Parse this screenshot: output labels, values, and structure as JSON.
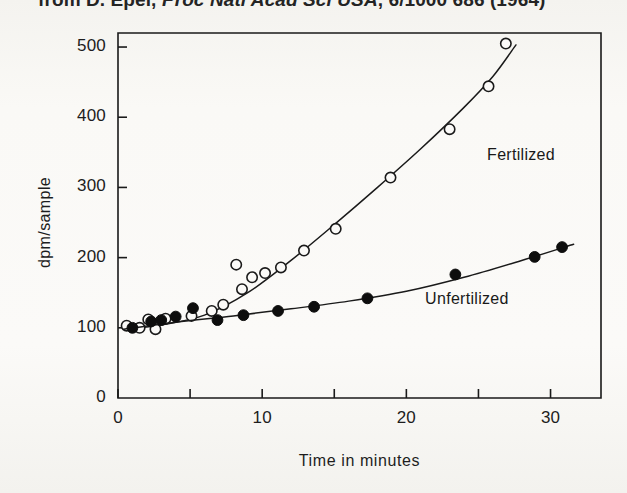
{
  "figure": {
    "caption_prefix": "from D. Epel, ",
    "caption_journal": "Proc Natl Acad Sci USA",
    "caption_suffix": ", 6/1000  686 (1964)"
  },
  "chart_data": {
    "type": "scatter",
    "title": "",
    "xlabel": "Time in minutes",
    "ylabel": "dpm/sample",
    "xlim": [
      0,
      33.5
    ],
    "ylim": [
      0,
      520
    ],
    "xticks": [
      0,
      5,
      10,
      15,
      20,
      25,
      30
    ],
    "xtick_labels": [
      "0",
      "",
      "10",
      "",
      "20",
      "",
      "30"
    ],
    "yticks": [
      0,
      100,
      200,
      300,
      400,
      500
    ],
    "ytick_labels": [
      "0",
      "100",
      "200",
      "300",
      "400",
      "500"
    ],
    "grid": false,
    "legend_position": "inline-on-curve",
    "series": [
      {
        "name": "Fertilized",
        "marker": "open-circle",
        "marker_color": "#ffffff",
        "marker_edge_color": "#1a1a1a",
        "line_color": "#1a1a1a",
        "label_x": 25.6,
        "label_y": 345,
        "points": [
          {
            "x": 0.6,
            "y": 103
          },
          {
            "x": 1.5,
            "y": 100
          },
          {
            "x": 2.1,
            "y": 112
          },
          {
            "x": 2.6,
            "y": 98
          },
          {
            "x": 3.3,
            "y": 113
          },
          {
            "x": 5.1,
            "y": 117
          },
          {
            "x": 6.5,
            "y": 124
          },
          {
            "x": 7.3,
            "y": 133
          },
          {
            "x": 8.2,
            "y": 190
          },
          {
            "x": 8.6,
            "y": 155
          },
          {
            "x": 9.3,
            "y": 172
          },
          {
            "x": 10.2,
            "y": 178
          },
          {
            "x": 11.3,
            "y": 186
          },
          {
            "x": 12.9,
            "y": 210
          },
          {
            "x": 15.1,
            "y": 241
          },
          {
            "x": 18.9,
            "y": 314
          },
          {
            "x": 23.0,
            "y": 383
          },
          {
            "x": 25.7,
            "y": 444
          },
          {
            "x": 26.9,
            "y": 505
          }
        ],
        "curve": [
          {
            "x": 0.4,
            "y": 98
          },
          {
            "x": 3.0,
            "y": 104
          },
          {
            "x": 6.0,
            "y": 118
          },
          {
            "x": 9.0,
            "y": 150
          },
          {
            "x": 12.0,
            "y": 196
          },
          {
            "x": 15.0,
            "y": 247
          },
          {
            "x": 18.0,
            "y": 300
          },
          {
            "x": 21.0,
            "y": 355
          },
          {
            "x": 24.0,
            "y": 414
          },
          {
            "x": 26.0,
            "y": 458
          },
          {
            "x": 27.6,
            "y": 503
          }
        ]
      },
      {
        "name": "Unfertilized",
        "marker": "filled-circle",
        "marker_color": "#0d0d0d",
        "marker_edge_color": "#0d0d0d",
        "line_color": "#1a1a1a",
        "label_x": 21.3,
        "label_y": 139,
        "points": [
          {
            "x": 1.0,
            "y": 100
          },
          {
            "x": 2.3,
            "y": 109
          },
          {
            "x": 3.0,
            "y": 111
          },
          {
            "x": 4.0,
            "y": 116
          },
          {
            "x": 5.2,
            "y": 128
          },
          {
            "x": 6.9,
            "y": 111
          },
          {
            "x": 8.7,
            "y": 118
          },
          {
            "x": 11.1,
            "y": 124
          },
          {
            "x": 13.6,
            "y": 130
          },
          {
            "x": 17.3,
            "y": 142
          },
          {
            "x": 23.4,
            "y": 176
          },
          {
            "x": 28.9,
            "y": 201
          },
          {
            "x": 30.8,
            "y": 215
          }
        ],
        "curve": [
          {
            "x": 0.4,
            "y": 98
          },
          {
            "x": 4.0,
            "y": 108
          },
          {
            "x": 8.0,
            "y": 117
          },
          {
            "x": 12.0,
            "y": 127
          },
          {
            "x": 16.0,
            "y": 138
          },
          {
            "x": 20.0,
            "y": 152
          },
          {
            "x": 24.0,
            "y": 172
          },
          {
            "x": 28.0,
            "y": 196
          },
          {
            "x": 31.6,
            "y": 219
          }
        ]
      }
    ]
  }
}
